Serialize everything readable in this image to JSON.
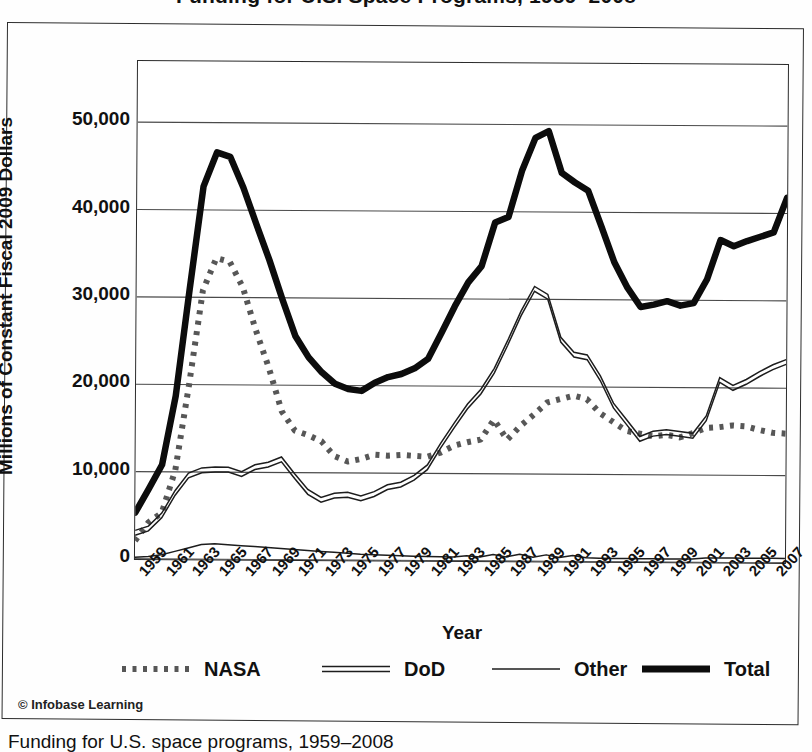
{
  "page": {
    "title": "Funding for U.S. Space Programs, 1959–2008",
    "copyright": "© Infobase Learning",
    "caption_partial": "Funding for U.S. space programs, 1959–2008"
  },
  "chart_data": {
    "type": "line",
    "title": "Funding for U.S. Space Programs, 1959–2008",
    "xlabel": "Year",
    "ylabel": "Millions of Constant Fiscal 2009 Dollars",
    "xlim": [
      1959,
      2008
    ],
    "ylim": [
      0,
      57000
    ],
    "yticks": [
      0,
      10000,
      20000,
      30000,
      40000,
      50000
    ],
    "ytick_labels": [
      "0",
      "10,000",
      "20,000",
      "30,000",
      "40,000",
      "50,000"
    ],
    "xtick_labels": [
      "1959",
      "1961",
      "1963",
      "1965",
      "1967",
      "1969",
      "1971",
      "1973",
      "1975",
      "1977",
      "1979",
      "1981",
      "1983",
      "1985",
      "1987",
      "1989",
      "1991",
      "1993",
      "1995",
      "1997",
      "1999",
      "2001",
      "2003",
      "2005",
      "2007"
    ],
    "grid": "horizontal",
    "legend_position": "below",
    "x": [
      1959,
      1960,
      1961,
      1962,
      1963,
      1964,
      1965,
      1966,
      1967,
      1968,
      1969,
      1970,
      1971,
      1972,
      1973,
      1974,
      1975,
      1976,
      1977,
      1978,
      1979,
      1980,
      1981,
      1982,
      1983,
      1984,
      1985,
      1986,
      1987,
      1988,
      1989,
      1990,
      1991,
      1992,
      1993,
      1994,
      1995,
      1996,
      1997,
      1998,
      1999,
      2000,
      2001,
      2002,
      2003,
      2004,
      2005,
      2006,
      2007,
      2008
    ],
    "series": [
      {
        "name": "NASA",
        "style": "dotted",
        "values": [
          2100,
          4200,
          5300,
          10200,
          20000,
          30800,
          34500,
          34100,
          31200,
          26300,
          22000,
          17000,
          14800,
          14300,
          13600,
          11900,
          11300,
          11600,
          12100,
          12000,
          12100,
          12000,
          11900,
          12400,
          13200,
          13600,
          13900,
          16200,
          13900,
          15500,
          16800,
          18200,
          18600,
          19000,
          18600,
          17000,
          16000,
          15000,
          14700,
          14400,
          14600,
          14300,
          14800,
          15400,
          15500,
          15700,
          15600,
          15200,
          14900,
          14800
        ]
      },
      {
        "name": "DoD",
        "style": "double",
        "values": [
          3000,
          3500,
          5000,
          7600,
          9600,
          10200,
          10300,
          10300,
          9800,
          10600,
          10900,
          11500,
          9600,
          7800,
          6900,
          7400,
          7500,
          7100,
          7600,
          8400,
          8700,
          9500,
          10700,
          13200,
          15500,
          17700,
          19400,
          21800,
          25000,
          28400,
          31200,
          30300,
          25400,
          23700,
          23400,
          21000,
          17900,
          16000,
          14100,
          14700,
          14900,
          14700,
          14500,
          16500,
          20900,
          20000,
          20700,
          21600,
          22400,
          23000
        ]
      },
      {
        "name": "Other",
        "style": "thin",
        "values": [
          200,
          300,
          500,
          900,
          1300,
          1700,
          1800,
          1700,
          1600,
          1500,
          1400,
          1300,
          1200,
          1100,
          1000,
          900,
          800,
          700,
          650,
          600,
          560,
          520,
          500,
          480,
          460,
          600,
          470,
          760,
          500,
          800,
          470,
          760,
          480,
          700,
          460,
          420,
          400,
          400,
          390,
          380,
          380,
          380,
          380,
          520,
          520,
          520,
          520,
          520,
          520,
          500
        ]
      },
      {
        "name": "Total",
        "style": "thick",
        "values": [
          5300,
          8000,
          10800,
          18700,
          30900,
          42700,
          46600,
          46100,
          42600,
          38400,
          34300,
          29800,
          25600,
          23200,
          21500,
          20200,
          19600,
          19400,
          20350,
          21000,
          21360,
          22020,
          23100,
          26080,
          29160,
          31900,
          33770,
          38760,
          39400,
          44700,
          48480,
          49260,
          44480,
          43400,
          42460,
          38420,
          34300,
          31400,
          29190,
          29480,
          29880,
          29380,
          29680,
          32420,
          36920,
          36220,
          36820,
          37320,
          37820,
          41800
        ]
      }
    ]
  },
  "legend": {
    "items": [
      {
        "label": "NASA",
        "style": "dotted"
      },
      {
        "label": "DoD",
        "style": "double"
      },
      {
        "label": "Other",
        "style": "thin"
      },
      {
        "label": "Total",
        "style": "thick"
      }
    ]
  }
}
